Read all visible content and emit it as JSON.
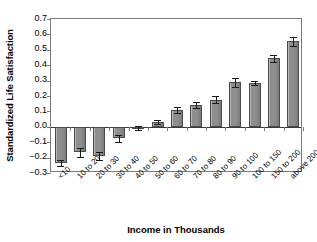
{
  "chart_data": {
    "type": "bar",
    "title": "",
    "xlabel": "Income in Thousands",
    "ylabel": "Standardized Life Satisfaction",
    "categories": [
      "<10",
      "10 to 20",
      "20 to 30",
      "30 to 40",
      "40 to 50",
      "50 to 60",
      "60 to 70",
      "70 to 80",
      "80 to 90",
      "90 to 100",
      "100 to 150",
      "150 to 200",
      "above 200"
    ],
    "values": [
      -0.235,
      -0.165,
      -0.19,
      -0.075,
      -0.01,
      0.03,
      0.11,
      0.14,
      0.175,
      0.29,
      0.285,
      0.445,
      0.555
    ],
    "errors": [
      0.018,
      0.028,
      0.025,
      0.022,
      0.012,
      0.015,
      0.018,
      0.018,
      0.022,
      0.03,
      0.014,
      0.022,
      0.028
    ],
    "ylim": [
      -0.3,
      0.7
    ],
    "ytick_labels": [
      "0.7",
      "0.6",
      "0.5",
      "0.4",
      "0.3",
      "0.2",
      "0.1",
      "0.0",
      "−0.1",
      "−0.2",
      "−0.3"
    ],
    "ytick_values": [
      0.7,
      0.6,
      0.5,
      0.4,
      0.3,
      0.2,
      0.1,
      0.0,
      -0.1,
      -0.2,
      -0.3
    ],
    "grid": false,
    "legend": "none",
    "bar_color": "#8e8e8e",
    "bar_edge_color": "#4a4a4a",
    "error_color": "#1a1a1a",
    "axis_color": "#7a7a7a",
    "zero_line_color": "#3b3b3b"
  }
}
